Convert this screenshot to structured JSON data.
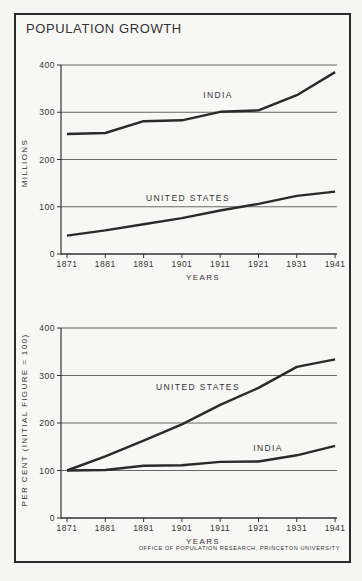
{
  "title": "POPULATION GROWTH",
  "credit": "OFFICE OF POPULATION RESEARCH, PRINCETON UNIVERSITY",
  "chart_data": [
    {
      "type": "line",
      "title": "Population (millions)",
      "xlabel": "YEARS",
      "ylabel": "MILLIONS",
      "x": [
        1871,
        1881,
        1891,
        1901,
        1911,
        1921,
        1931,
        1941
      ],
      "ylim": [
        0,
        400
      ],
      "yticks": [
        0,
        100,
        200,
        300,
        400
      ],
      "grid": true,
      "series": [
        {
          "name": "INDIA",
          "values": [
            254,
            256,
            281,
            283,
            301,
            304,
            336,
            385
          ]
        },
        {
          "name": "UNITED STATES",
          "values": [
            39,
            50,
            63,
            76,
            92,
            106,
            123,
            132
          ]
        }
      ]
    },
    {
      "type": "line",
      "title": "Per cent of initial figure",
      "xlabel": "YEARS",
      "ylabel": "PER CENT (INITIAL FIGURE = 100)",
      "x": [
        1871,
        1881,
        1891,
        1901,
        1911,
        1921,
        1931,
        1941
      ],
      "ylim": [
        0,
        400
      ],
      "yticks": [
        0,
        100,
        200,
        300,
        400
      ],
      "grid": true,
      "series": [
        {
          "name": "UNITED STATES",
          "values": [
            100,
            130,
            163,
            197,
            238,
            274,
            318,
            334
          ]
        },
        {
          "name": "INDIA",
          "values": [
            100,
            101,
            110,
            111,
            118,
            119,
            132,
            152
          ]
        }
      ]
    }
  ]
}
